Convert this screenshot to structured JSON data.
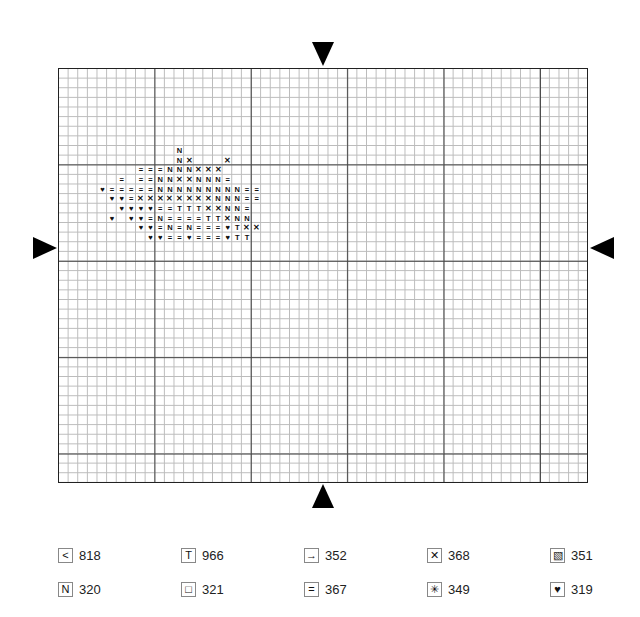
{
  "chart_data": {
    "type": "table",
    "title": "",
    "grid": {
      "columns": 55,
      "rows": 43,
      "major_every": 10
    },
    "center_markers": [
      "top",
      "bottom",
      "left",
      "right"
    ],
    "legend": [
      {
        "symbol": "<",
        "name": "less-than",
        "code": "818"
      },
      {
        "symbol": "T",
        "name": "T",
        "code": "966"
      },
      {
        "symbol": "→",
        "name": "arrow",
        "code": "352"
      },
      {
        "symbol": "✕",
        "name": "cross",
        "code": "368"
      },
      {
        "symbol": "▧",
        "name": "diagonal-hatch",
        "code": "351"
      },
      {
        "symbol": "N",
        "name": "N",
        "code": "320"
      },
      {
        "symbol": "□",
        "name": "square",
        "code": "321"
      },
      {
        "symbol": "=",
        "name": "equals",
        "code": "367"
      },
      {
        "symbol": "✳",
        "name": "star",
        "code": "349"
      },
      {
        "symbol": "♥",
        "name": "heart",
        "code": "319"
      }
    ]
  },
  "legend_rows": [
    [
      {
        "symbol": "<",
        "code": "818"
      },
      {
        "symbol": "T",
        "code": "966"
      },
      {
        "symbol": "→",
        "code": "352"
      },
      {
        "symbol": "✕",
        "code": "368"
      },
      {
        "symbol": "▧",
        "code": "351"
      }
    ],
    [
      {
        "symbol": "N",
        "code": "320"
      },
      {
        "symbol": "□",
        "code": "321"
      },
      {
        "symbol": "=",
        "code": "367"
      },
      {
        "symbol": "✳",
        "code": "349"
      },
      {
        "symbol": "♥",
        "code": "319"
      }
    ]
  ],
  "pattern_rows": [
    {
      "row": 8,
      "start": 12,
      "cells": "N"
    },
    {
      "row": 9,
      "start": 12,
      "cells": "NX...X"
    },
    {
      "row": 10,
      "start": 8,
      "cells": "===NNNXXX"
    },
    {
      "row": 11,
      "start": 6,
      "cells": "=.==NNXXNNN="
    },
    {
      "row": 12,
      "start": 4,
      "cells": "H=====NNNNNNNNN=="
    },
    {
      "row": 13,
      "start": 5,
      "cells": "HH=XXXXXXXXNNN=="
    },
    {
      "row": 14,
      "start": 6,
      "cells": "HHHH==TTTXXNN="
    },
    {
      "row": 15,
      "start": 5,
      "cells": "H.HH=N====TTXNN"
    },
    {
      "row": 16,
      "start": 8,
      "cells": "HH=N=N===HTXX"
    },
    {
      "row": 17,
      "start": 9,
      "cells": "HH==H===HTT"
    }
  ]
}
